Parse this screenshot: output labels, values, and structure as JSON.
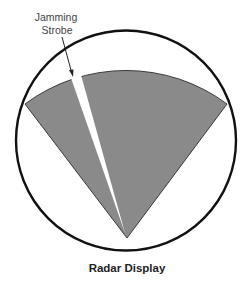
{
  "diagram": {
    "title": "Radar Display",
    "callout": {
      "line1": "Jamming",
      "line2": "Strobe"
    },
    "colors": {
      "sector_fill": "#8a8a8a",
      "sector_stroke": "#3a3a3a",
      "strobe_fill": "#ffffff",
      "scope_stroke": "#111111",
      "background": "#ffffff"
    },
    "elements": {
      "scope_circle": "radar scope outline",
      "scan_sector": "radar scan sector",
      "jamming_strobe": "white strobe wedge through sector",
      "callout_arrow": "arrow pointing to strobe"
    }
  }
}
